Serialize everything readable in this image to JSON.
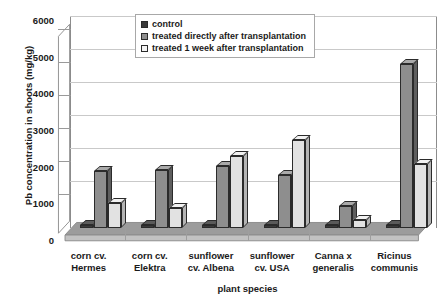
{
  "chart_data": {
    "type": "bar",
    "title": "",
    "xlabel": "plant species",
    "ylabel": "Pb concentration in shoots (mg/kg)",
    "ylim": [
      0,
      6000
    ],
    "ytick_step": 1000,
    "yticks": [
      0,
      1000,
      2000,
      3000,
      4000,
      5000,
      6000
    ],
    "ytick_labels": [
      "0",
      "1000",
      "2000",
      "3000",
      "4000",
      "5000",
      "6000"
    ],
    "grid": true,
    "legend_position": "top-center",
    "categories": [
      "corn cv. Hermes",
      "corn cv. Elektra",
      "sunflower cv. Albena",
      "sunflower cv. USA",
      "Canna x generalis",
      "Ricinus communis"
    ],
    "category_lines": [
      [
        "corn cv.",
        "Hermes"
      ],
      [
        "corn cv.",
        "Elektra"
      ],
      [
        "sunflower",
        "cv. Albena"
      ],
      [
        "sunflower",
        "cv. USA"
      ],
      [
        "Canna x",
        "generalis"
      ],
      [
        "Ricinus",
        "communis"
      ]
    ],
    "series": [
      {
        "name": "control",
        "color": "#3a3a3a",
        "values": [
          40,
          50,
          60,
          50,
          60,
          60
        ]
      },
      {
        "name": "treated directly after transplantation",
        "color": "#8e8e8e",
        "values": [
          1770,
          1800,
          1950,
          1650,
          680,
          5120
        ]
      },
      {
        "name": "treated 1 week after transplantation",
        "color": "#e2e2e2",
        "values": [
          790,
          630,
          2260,
          2760,
          250,
          2010
        ]
      }
    ]
  },
  "axis": {
    "y_title": "Pb concentration in shoots (mg/kg)",
    "x_title": "plant species"
  },
  "legend": {
    "items": [
      {
        "label": "control",
        "swatch": "legend-swatch-control"
      },
      {
        "label": "treated directly after transplantation",
        "swatch": "legend-swatch-direct"
      },
      {
        "label": "treated 1 week after transplantation",
        "swatch": "legend-swatch-week"
      }
    ]
  },
  "title_remnant": ""
}
